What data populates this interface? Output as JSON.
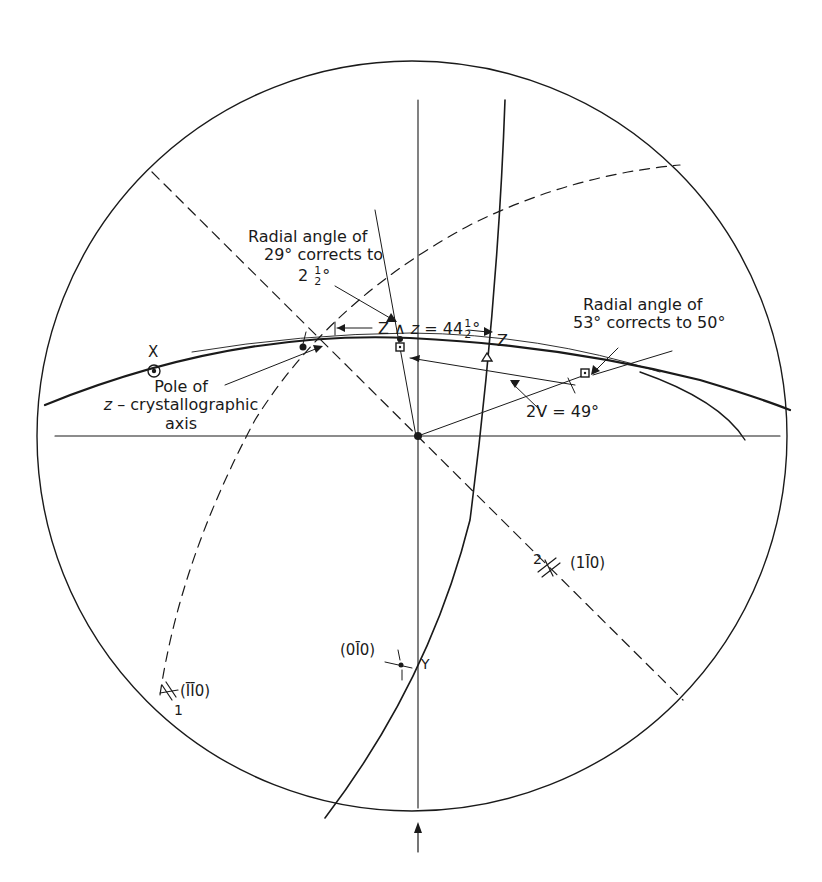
{
  "diagram": {
    "type": "stereographic-projection",
    "primitive_circle": {
      "cx": 412,
      "cy": 436,
      "r": 375
    },
    "colors": {
      "ink": "#1a1a1a",
      "background": "#ffffff"
    }
  },
  "labels": {
    "radial_left": {
      "line1": "Radial angle of",
      "line2": "29° corrects to",
      "line3_whole": "2",
      "line3_num": "1",
      "line3_den": "2",
      "line3_deg": "°"
    },
    "z_angle": {
      "prefix": "Z ∧ ",
      "var": "z",
      "eq": " = 44",
      "num": "1",
      "den": "2",
      "deg": "°"
    },
    "radial_right": {
      "line1": "Radial angle of",
      "line2": "53° corrects to 50°"
    },
    "pole": {
      "line1": "Pole of",
      "line2_var": "z",
      "line2_rest": " – crystallographic",
      "line3": "axis"
    },
    "two_v": "2V = 49°",
    "x_axis": "X",
    "z_axis": "Z",
    "y_axis": "Y",
    "face_010": "(0̅0̅ 10)",
    "face_010_display": "(0Ī0)",
    "face_1m10": "(1Ī0)",
    "face_m1m10": "(ĪĪ0)",
    "marker_1": "1",
    "marker_2": "2"
  }
}
